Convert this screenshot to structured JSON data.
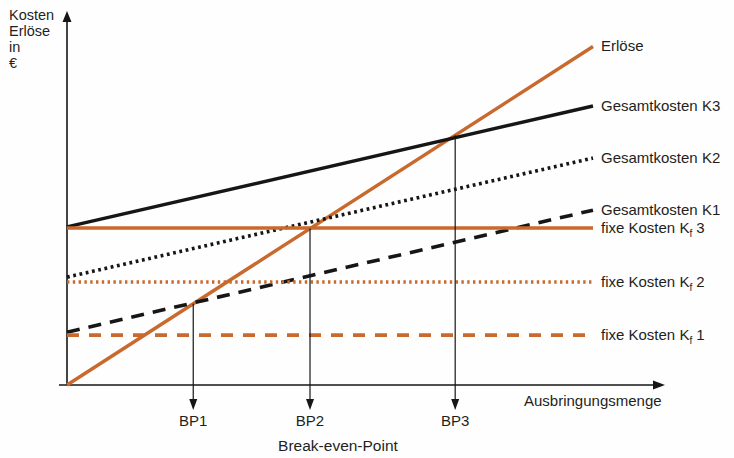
{
  "y_axis_label_lines": [
    "Kosten",
    "Erlöse",
    "in",
    "€"
  ],
  "x_axis_label": "Ausbringungsmenge",
  "caption": "Break-even-Point",
  "colors": {
    "orange": "#c8692d",
    "black": "#161616",
    "text": "#1f1f1d"
  },
  "chart_data": {
    "type": "line",
    "title": "",
    "xlabel": "Ausbringungsmenge",
    "ylabel": "Kosten Erlöse in €",
    "xlim": [
      0,
      11.3
    ],
    "ylim": [
      0,
      100
    ],
    "grid": false,
    "legend_position": "right-of-line-ends",
    "series": [
      {
        "name": "Erlöse",
        "label": {
          "pre": "Erlöse",
          "sub": "",
          "post": ""
        },
        "color": "orange",
        "style": "solid",
        "points": [
          [
            0,
            0
          ],
          [
            10,
            91
          ]
        ]
      },
      {
        "name": "Gesamtkosten K3",
        "label": {
          "pre": "Gesamtkosten K3",
          "sub": "",
          "post": ""
        },
        "color": "black",
        "style": "solid",
        "points": [
          [
            0,
            42.5
          ],
          [
            10,
            75
          ]
        ]
      },
      {
        "name": "Gesamtkosten K2",
        "label": {
          "pre": "Gesamtkosten K2",
          "sub": "",
          "post": ""
        },
        "color": "black",
        "style": "dotted",
        "points": [
          [
            0,
            29
          ],
          [
            10,
            61
          ]
        ]
      },
      {
        "name": "Gesamtkosten K1",
        "label": {
          "pre": "Gesamtkosten K1",
          "sub": "",
          "post": ""
        },
        "color": "black",
        "style": "dashed",
        "points": [
          [
            0,
            14.2
          ],
          [
            10,
            47
          ]
        ]
      },
      {
        "name": "fixe Kosten Kf3",
        "label": {
          "pre": "fixe Kosten K",
          "sub": "f",
          "post": " 3"
        },
        "color": "orange",
        "style": "solid",
        "points": [
          [
            0,
            42.2
          ],
          [
            10,
            42.2
          ]
        ]
      },
      {
        "name": "fixe Kosten Kf2",
        "label": {
          "pre": "fixe Kosten K",
          "sub": "f",
          "post": " 2"
        },
        "color": "orange",
        "style": "dotted",
        "points": [
          [
            0,
            27.7
          ],
          [
            10,
            27.7
          ]
        ]
      },
      {
        "name": "fixe Kosten Kf1",
        "label": {
          "pre": "fixe Kosten K",
          "sub": "f",
          "post": " 1"
        },
        "color": "orange",
        "style": "dashed",
        "points": [
          [
            0,
            13.4
          ],
          [
            10,
            13.4
          ]
        ]
      }
    ],
    "break_even_points": [
      {
        "label": "BP1",
        "x": 2.4
      },
      {
        "label": "BP2",
        "x": 4.62
      },
      {
        "label": "BP3",
        "x": 7.38
      }
    ]
  }
}
